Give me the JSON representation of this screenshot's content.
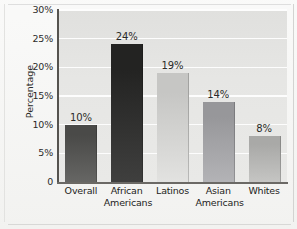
{
  "chart_data": {
    "type": "bar",
    "title": "",
    "xlabel": "",
    "ylabel": "Percentage",
    "categories": [
      "Overall",
      "African Americans",
      "Latinos",
      "Asian Americans",
      "Whites"
    ],
    "category_lines": [
      [
        "Overall"
      ],
      [
        "African",
        "Americans"
      ],
      [
        "Latinos"
      ],
      [
        "Asian",
        "Americans"
      ],
      [
        "Whites"
      ]
    ],
    "values": [
      10,
      24,
      19,
      14,
      8
    ],
    "data_labels": [
      "10%",
      "24%",
      "19%",
      "14%",
      "8%"
    ],
    "ylim": [
      0,
      30
    ],
    "yticks": [
      0,
      5,
      10,
      15,
      20,
      25,
      30
    ],
    "ytick_labels": [
      "0",
      "5%",
      "10%",
      "15%",
      "20%",
      "25%",
      "30%"
    ],
    "grid": "horizontal",
    "legend": "none",
    "bar_colors": [
      "#4a4a48",
      "#232322",
      "#c6c6c4",
      "#97979a",
      "#a9a9a7"
    ],
    "plot_background": "#e5e5e3",
    "gridline_color": "#fdfdfd",
    "axis_color": "#55534f"
  }
}
